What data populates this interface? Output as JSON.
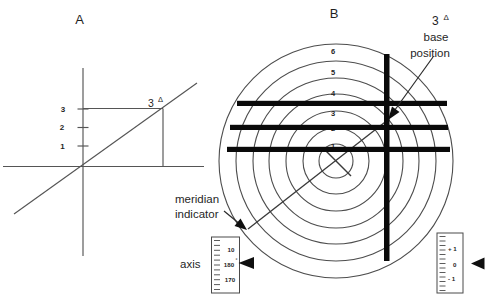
{
  "figure": {
    "panel_a": {
      "label": "A",
      "axis_ticks": [
        "3",
        "2",
        "1"
      ],
      "point_label": {
        "base": "3",
        "sup": "Δ"
      }
    },
    "panel_b": {
      "label": "B",
      "point_label": {
        "base": "3",
        "sup": "Δ"
      },
      "callouts": {
        "base_position_line1": "base",
        "base_position_line2": "position",
        "meridian_line1": "meridian",
        "meridian_line2": "indicator",
        "axis": "axis"
      },
      "ring_numbers": [
        "6",
        "5",
        "4",
        "3",
        "2",
        "1"
      ],
      "meridian_scale": {
        "top": "10",
        "middle": "180",
        "middle_sup": "°",
        "bottom": "170"
      },
      "level_scale": {
        "top": "+ 1",
        "middle": "0",
        "bottom": "- 1"
      }
    },
    "colors": {
      "background": "#ffffff",
      "thin_line": "#4d4d4d",
      "thick_bar": "#0a0a0a",
      "text": "#1f1f1f"
    }
  }
}
